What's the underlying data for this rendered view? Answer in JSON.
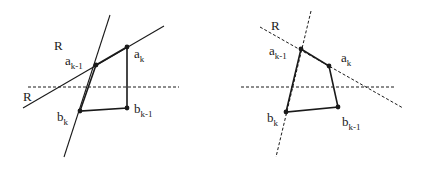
{
  "figure": {
    "panels": [
      {
        "id": "left",
        "description": "Solid lines R through a_{k-1}; quadrilateral a_{k-1}, a_k, b_{k-1}, b_k with dashed horizontal line",
        "lines": [
          {
            "name": "steep-line",
            "style": "solid",
            "x1": 110,
            "y1": 15,
            "x2": 64,
            "y2": 157
          },
          {
            "name": "shallow-line-R",
            "style": "solid",
            "x1": 23,
            "y1": 108,
            "x2": 164,
            "y2": 26
          },
          {
            "name": "horizontal-dashed-line",
            "style": "dashed",
            "x1": 28,
            "y1": 87,
            "x2": 179,
            "y2": 87
          }
        ],
        "points": [
          {
            "name": "a_k-1",
            "x": 96,
            "y": 65
          },
          {
            "name": "a_k",
            "x": 127,
            "y": 47
          },
          {
            "name": "b_k-1",
            "x": 127,
            "y": 108
          },
          {
            "name": "b_k",
            "x": 80,
            "y": 111
          }
        ],
        "labels": [
          {
            "main": "R",
            "sub": "",
            "x": 54,
            "y": 50
          },
          {
            "main": "R",
            "sub": "",
            "x": 23,
            "y": 101
          },
          {
            "main": "a",
            "sub": "k-1",
            "x": 65,
            "y": 65
          },
          {
            "main": "a",
            "sub": "k",
            "x": 134,
            "y": 58
          },
          {
            "main": "b",
            "sub": "k",
            "x": 57,
            "y": 121
          },
          {
            "main": "b",
            "sub": "k-1",
            "x": 134,
            "y": 113
          }
        ]
      },
      {
        "id": "right",
        "description": "Dashed lines R through a_{k-1}; quadrilateral a_{k-1}, a_k, b_{k-1}, b_k with dashed horizontal line",
        "lines": [
          {
            "name": "steep-dashed-line",
            "style": "dashed",
            "x1": 311,
            "y1": 11,
            "x2": 276,
            "y2": 157
          },
          {
            "name": "shallow-dashed-line-R",
            "style": "dashed",
            "x1": 260,
            "y1": 27,
            "x2": 403,
            "y2": 108
          },
          {
            "name": "horizontal-dashed-line",
            "style": "dashed",
            "x1": 241,
            "y1": 87,
            "x2": 394,
            "y2": 87
          }
        ],
        "points": [
          {
            "name": "a_k-1",
            "x": 301,
            "y": 49
          },
          {
            "name": "a_k",
            "x": 329,
            "y": 66
          },
          {
            "name": "b_k-1",
            "x": 338,
            "y": 107
          },
          {
            "name": "b_k",
            "x": 286,
            "y": 112
          }
        ],
        "labels": [
          {
            "main": "R",
            "sub": "",
            "x": 271,
            "y": 30
          },
          {
            "main": "a",
            "sub": "k-1",
            "x": 269,
            "y": 55
          },
          {
            "main": "a",
            "sub": "k",
            "x": 341,
            "y": 62
          },
          {
            "main": "b",
            "sub": "k",
            "x": 267,
            "y": 122
          },
          {
            "main": "b",
            "sub": "k-1",
            "x": 342,
            "y": 126
          }
        ]
      }
    ]
  }
}
